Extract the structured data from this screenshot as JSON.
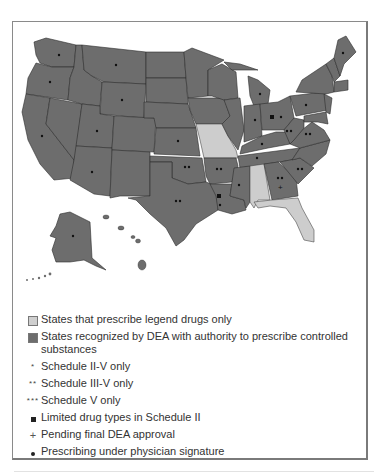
{
  "figure": {
    "type": "map",
    "region": "United States",
    "colors": {
      "legend_only": "#cfcfcf",
      "dea_recognized": "#6d6d6d",
      "border": "#2e2e2e"
    }
  },
  "legend": {
    "items": [
      {
        "symbol": "light-swatch",
        "label": "States that prescribe legend drugs only"
      },
      {
        "symbol": "dark-swatch",
        "label": "States recognized by DEA with authority to prescribe controlled substances"
      },
      {
        "symbol": "*",
        "label": "Schedule II-V only"
      },
      {
        "symbol": "**",
        "label": "Schedule III-V only"
      },
      {
        "symbol": "***",
        "label": "Schedule V only"
      },
      {
        "symbol": "■",
        "label": "Limited drug types in Schedule II"
      },
      {
        "symbol": "+",
        "label": "Pending final DEA approval"
      },
      {
        "symbol": "•",
        "label": "Prescribing under physician signature"
      }
    ]
  },
  "states": {
    "legend_only": [
      "Missouri",
      "Alabama",
      "Florida"
    ],
    "markers": {
      "single_dot": [
        "Washington",
        "Oregon",
        "Montana",
        "Wyoming",
        "California",
        "Utah",
        "Arizona",
        "Kansas",
        "Indiana",
        "Michigan",
        "Kentucky",
        "Tennessee",
        "Mississippi",
        "Pennsylvania",
        "Maine",
        "Alaska",
        "Louisiana"
      ],
      "double_dot": [
        "Oklahoma",
        "Arkansas",
        "Texas",
        "West Virginia",
        "Virginia",
        "Georgia",
        "South Carolina",
        "Ohio"
      ],
      "square": [
        "Ohio",
        "Louisiana"
      ],
      "plus": [
        "Georgia"
      ]
    }
  }
}
